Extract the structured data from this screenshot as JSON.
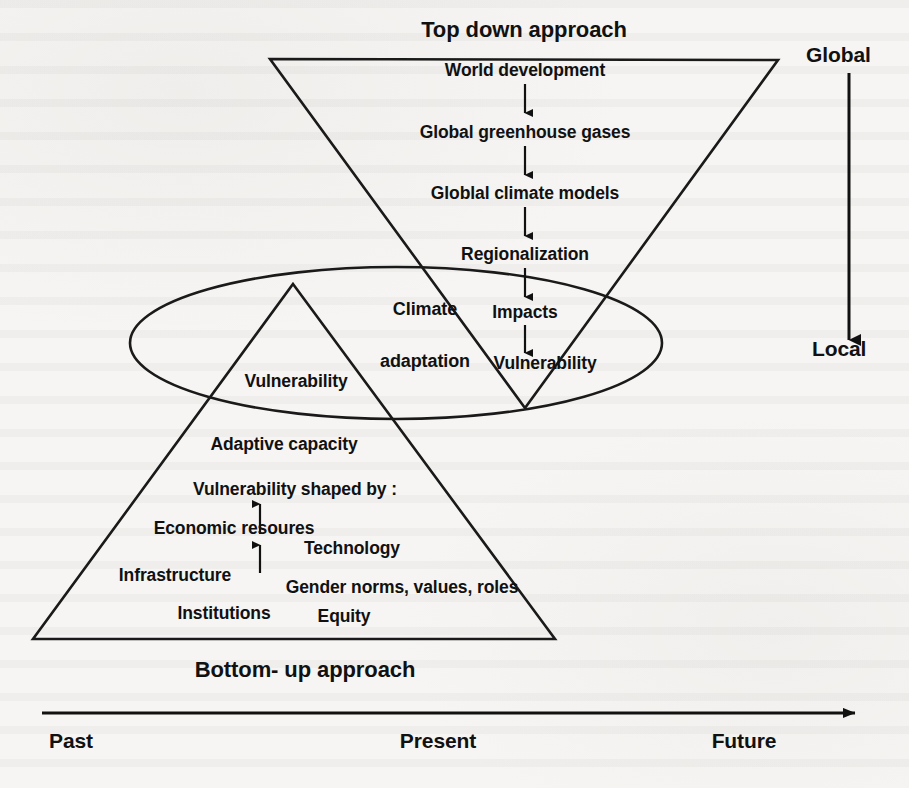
{
  "figure": {
    "title_top": "Top down approach",
    "title_bottom": "Bottom- up approach"
  },
  "scale_axis": {
    "top_label": "Global",
    "bottom_label": "Local",
    "arrow_direction": "down",
    "arrow_icon": "down-arrow-icon"
  },
  "time_axis": {
    "arrow_icon": "right-arrow-icon",
    "arrow_direction": "right",
    "ticks": [
      "Past",
      "Present",
      "Future"
    ]
  },
  "top_down_chain": {
    "arrow_icon": "down-arrow-icon",
    "steps": [
      "World development",
      "Global greenhouse gases",
      "Globlal climate models",
      "Regionalization",
      "Impacts",
      "Vulnerability"
    ]
  },
  "overlap_region": {
    "shape": "ellipse",
    "label_line1": "Climate",
    "label_line2": "adaptation"
  },
  "bottom_up_chain": {
    "arrow_icon": "up-arrow-icon",
    "steps": [
      "Vulnerability",
      "Adaptive capacity",
      "Vulnerability shaped by :"
    ],
    "factors": [
      "Economic resoures",
      "Technology",
      "Infrastructure",
      "Gender norms, values, roles",
      "Institutions",
      "Equity"
    ]
  },
  "colors": {
    "ink": "#111111",
    "stroke": "#1a1a1a",
    "background": "#f6f5f3"
  }
}
